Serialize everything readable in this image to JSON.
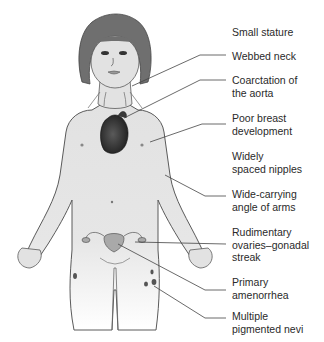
{
  "diagram": {
    "labels": [
      {
        "id": "small-stature",
        "text": "Small stature"
      },
      {
        "id": "webbed-neck",
        "text": "Webbed neck"
      },
      {
        "id": "coarctation-aorta",
        "text": "Coarctation of\nthe aorta"
      },
      {
        "id": "poor-breast-development",
        "text": "Poor breast\ndevelopment"
      },
      {
        "id": "widely-spaced-nipples",
        "text": "Widely\nspaced nipples"
      },
      {
        "id": "wide-carrying-angle",
        "text": "Wide-carrying\nangle of arms"
      },
      {
        "id": "rudimentary-ovaries",
        "text": "Rudimentary\novaries–gonadal\nstreak"
      },
      {
        "id": "primary-amenorrhea",
        "text": "Primary\namenorrhea"
      },
      {
        "id": "pigmented-nevi",
        "text": "Multiple\npigmented nevi"
      }
    ],
    "colors": {
      "skin": "#e2e2e2",
      "outline": "#555555",
      "hair": "#6f6f6f",
      "heart": "#2e2e2e",
      "uterus": "#a9a9a9",
      "leader": "#444444",
      "text": "#2a2a2a"
    }
  }
}
